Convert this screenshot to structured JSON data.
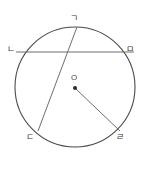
{
  "figure": {
    "kind": "circle-geometry-diagram",
    "width": 148,
    "height": 185,
    "background_color": "#ffffff",
    "stroke_color": "#4a4a4a",
    "chord_color": "#6e6e6e",
    "label_color": "#3a3a3a"
  },
  "circle": {
    "center_x": 75,
    "center_y": 87,
    "radius": 60,
    "stroke_width": 1.1
  },
  "center_point": {
    "label": "O",
    "dot_x": 75,
    "dot_y": 88,
    "dot_radius": 2,
    "label_x": 71,
    "label_y": 74
  },
  "points": [
    {
      "id": "g",
      "label": "ㄱ",
      "x": 77,
      "y": 27,
      "label_x": 70,
      "label_y": 14
    },
    {
      "id": "n",
      "label": "ㄴ",
      "x": 16,
      "y": 52,
      "label_x": 7,
      "label_y": 45
    },
    {
      "id": "m",
      "label": "ㅁ",
      "x": 134,
      "y": 52,
      "label_x": 126,
      "label_y": 45
    },
    {
      "id": "d",
      "label": "ㄷ",
      "x": 38,
      "y": 130,
      "label_x": 26,
      "label_y": 133
    },
    {
      "id": "r",
      "label": "ㄹ",
      "x": 120,
      "y": 130,
      "label_x": 116,
      "label_y": 133
    }
  ],
  "segments": [
    {
      "id": "chord-n-m",
      "from": "n",
      "to": "m",
      "kind": "chord",
      "x1": 16,
      "y1": 52,
      "x2": 134,
      "y2": 52
    },
    {
      "id": "chord-g-d",
      "from": "g",
      "to": "d",
      "kind": "chord",
      "x1": 77,
      "y1": 27,
      "x2": 38,
      "y2": 131
    },
    {
      "id": "radius-o-r",
      "from": "O",
      "to": "r",
      "kind": "radius",
      "x1": 76,
      "y1": 89,
      "x2": 120,
      "y2": 131
    }
  ]
}
